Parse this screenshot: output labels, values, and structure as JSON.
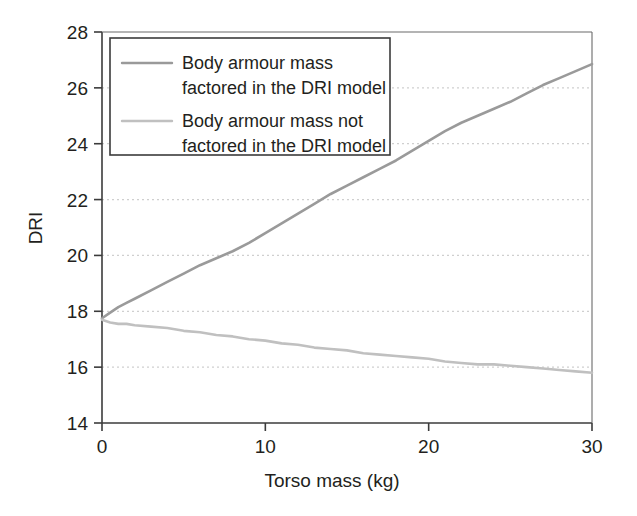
{
  "chart_data": {
    "type": "line",
    "title": "",
    "xlabel": "Torso mass (kg)",
    "ylabel": "DRI",
    "xlim": [
      0,
      30
    ],
    "ylim": [
      14,
      28
    ],
    "xticks": [
      0,
      10,
      20,
      30
    ],
    "yticks": [
      14,
      16,
      18,
      20,
      22,
      24,
      26,
      28
    ],
    "xtick_labels": [
      "0",
      "10",
      "20",
      "30"
    ],
    "ytick_labels": [
      "14",
      "16",
      "18",
      "20",
      "22",
      "24",
      "26",
      "28"
    ],
    "grid": "horizontal-dotted",
    "legend_position": "top-left-inside",
    "series": [
      {
        "name": "Body armour mass factored in the DRI model",
        "legend_line_1": "Body armour mass",
        "legend_line_2": "factored in the DRI model",
        "color": "#9a9a9a",
        "x": [
          0,
          0.5,
          1,
          1.5,
          2,
          3,
          4,
          5,
          6,
          7,
          8,
          9,
          10,
          11,
          12,
          13,
          14,
          15,
          16,
          17,
          18,
          19,
          20,
          21,
          22,
          23,
          24,
          25,
          26,
          27,
          28,
          29,
          30
        ],
        "y": [
          17.75,
          17.95,
          18.15,
          18.3,
          18.45,
          18.75,
          19.05,
          19.35,
          19.65,
          19.9,
          20.15,
          20.45,
          20.8,
          21.15,
          21.5,
          21.85,
          22.2,
          22.5,
          22.8,
          23.1,
          23.4,
          23.75,
          24.1,
          24.45,
          24.75,
          25.0,
          25.25,
          25.5,
          25.8,
          26.1,
          26.35,
          26.6,
          26.85
        ]
      },
      {
        "name": "Body armour mass not factored in the DRI model",
        "legend_line_1": "Body armour mass not",
        "legend_line_2": "factored in the DRI model",
        "color": "#c0c0c0",
        "x": [
          0,
          0.5,
          1,
          1.5,
          2,
          3,
          4,
          5,
          6,
          7,
          8,
          9,
          10,
          11,
          12,
          13,
          14,
          15,
          16,
          17,
          18,
          19,
          20,
          21,
          22,
          23,
          24,
          25,
          26,
          27,
          28,
          29,
          30
        ],
        "y": [
          17.7,
          17.6,
          17.55,
          17.55,
          17.5,
          17.45,
          17.4,
          17.3,
          17.25,
          17.15,
          17.1,
          17.0,
          16.95,
          16.85,
          16.8,
          16.7,
          16.65,
          16.6,
          16.5,
          16.45,
          16.4,
          16.35,
          16.3,
          16.2,
          16.15,
          16.1,
          16.1,
          16.05,
          16.0,
          15.95,
          15.9,
          15.85,
          15.8
        ]
      }
    ]
  }
}
